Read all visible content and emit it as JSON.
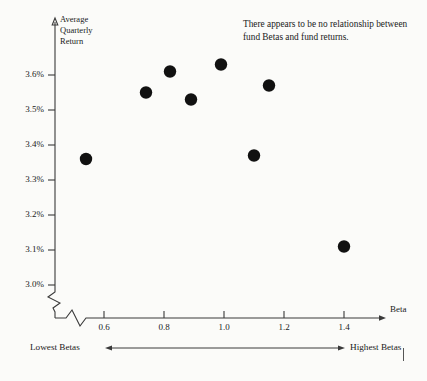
{
  "chart_data": {
    "type": "scatter",
    "title": "",
    "xlabel": "Beta",
    "ylabel": "Average Quarterly Return",
    "xlim": [
      0.5,
      1.55
    ],
    "ylim": [
      2.95,
      3.68
    ],
    "grid": false,
    "legend": null,
    "x_tick_labels": [
      "0.6",
      "0.8",
      "1.0",
      "1.2",
      "1.4"
    ],
    "x_tick_values": [
      0.6,
      0.8,
      1.0,
      1.2,
      1.4
    ],
    "y_tick_labels": [
      "3.6%",
      "3.5%",
      "3.4%",
      "3.3%",
      "3.2%",
      "3.1%",
      "3.0%"
    ],
    "y_tick_values": [
      3.6,
      3.5,
      3.4,
      3.3,
      3.2,
      3.1,
      3.0
    ],
    "axis_break_x": true,
    "axis_break_y": true,
    "points": [
      {
        "x": 0.54,
        "y": 3.36
      },
      {
        "x": 0.74,
        "y": 3.55
      },
      {
        "x": 0.82,
        "y": 3.61
      },
      {
        "x": 0.89,
        "y": 3.53
      },
      {
        "x": 0.99,
        "y": 3.63
      },
      {
        "x": 1.1,
        "y": 3.37
      },
      {
        "x": 1.15,
        "y": 3.57
      },
      {
        "x": 1.4,
        "y": 3.11
      }
    ],
    "annotations": [
      {
        "text": "There appears to be no relationship between fund Betas and fund returns."
      }
    ]
  },
  "axis": {
    "y_label_lines": [
      "Average",
      "Quarterly",
      "Return"
    ],
    "y_label_full": "Average Quarterly Return",
    "x_label": "Beta"
  },
  "range_bar": {
    "left_label": "Lowest Betas",
    "right_label": "Highest Betas"
  },
  "annotation": {
    "text": "There appears to be no relationship between fund Betas and fund returns."
  },
  "colors": {
    "dot": "#111111",
    "axis": "#3a3a3a",
    "text": "#1a1a1a",
    "background": "#fbfbf9"
  }
}
